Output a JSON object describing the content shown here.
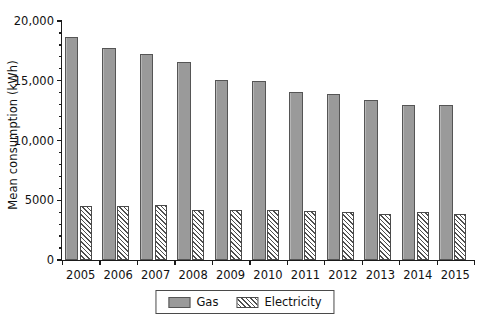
{
  "chart_data": {
    "type": "bar",
    "title": "",
    "xlabel": "",
    "ylabel": "Mean consumption (kWh)",
    "categories": [
      "2005",
      "2006",
      "2007",
      "2008",
      "2009",
      "2010",
      "2011",
      "2012",
      "2013",
      "2014",
      "2015"
    ],
    "series": [
      {
        "name": "Gas",
        "values": [
          18700,
          17750,
          17200,
          16600,
          15100,
          14950,
          14100,
          13900,
          13350,
          13000,
          12950
        ],
        "color": "#9a9a9a",
        "pattern": "solid"
      },
      {
        "name": "Electricity",
        "values": [
          4550,
          4520,
          4580,
          4180,
          4150,
          4160,
          4130,
          4000,
          3870,
          4010,
          3820
        ],
        "color": "#ffffff",
        "pattern": "diagonal-hatch"
      }
    ],
    "ylim": [
      0,
      20000
    ],
    "ytick_values": [
      0,
      5000,
      10000,
      15000,
      20000
    ],
    "ytick_labels": [
      "0",
      "5000",
      "10,000",
      "15,000",
      "20,000"
    ],
    "yminor_step": 1000,
    "grid": false,
    "legend_position": "bottom-center",
    "legend_entries": [
      "Gas",
      "Electricity"
    ]
  }
}
